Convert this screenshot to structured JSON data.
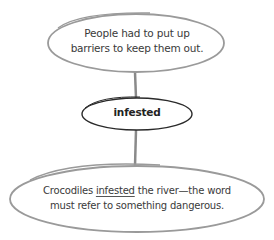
{
  "diagram": {
    "type": "concept-map",
    "nodes": {
      "top": {
        "line1": "People had to put up",
        "line2": "barriers to keep them out."
      },
      "center": {
        "label": "infested"
      },
      "bottom": {
        "line1_before": "Crocodiles ",
        "line1_underlined": "infested",
        "line1_after": " the river—the word",
        "line2": "must refer to something dangerous."
      }
    },
    "colors": {
      "outline_light": "#8a8a8a",
      "outline_dark": "#2a2a2a",
      "text": "#3a3a3a"
    }
  }
}
